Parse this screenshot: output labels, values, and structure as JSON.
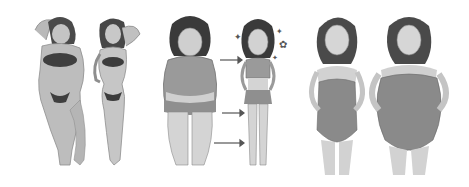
{
  "image": {
    "width": 469,
    "height": 187,
    "background": "#ffffff",
    "style": "grayscale illustration collage",
    "panels": [
      {
        "id": "panel-1",
        "x": 0,
        "width": 155,
        "description": "plus-size woman and slim woman in bikinis, arms raised behind heads"
      },
      {
        "id": "panel-2",
        "x": 158,
        "width": 145,
        "description": "before/after weight loss: heavier woman in tank top and shorts, arrows, slimmer woman in crop top and shorts with sparkles"
      },
      {
        "id": "panel-3",
        "x": 305,
        "width": 164,
        "description": "slim woman and heavier woman in strapless one-piece swimsuits, hands on hips"
      }
    ]
  }
}
